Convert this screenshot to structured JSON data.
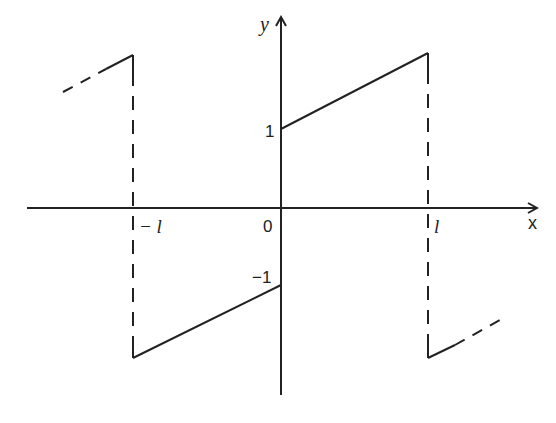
{
  "diagram": {
    "type": "function-graph",
    "colors": {
      "ink": "#222222",
      "background": "#ffffff"
    },
    "axes": {
      "x_label": "x",
      "y_label": "y",
      "origin_label": "0"
    },
    "ticks": {
      "x_neg": "− l",
      "x_pos": "l",
      "y_pos": "1",
      "y_neg": "−1"
    },
    "segments": [
      {
        "name": "right-upper",
        "from": [
          0,
          1
        ],
        "to": [
          "l",
          "max"
        ],
        "style": "solid"
      },
      {
        "name": "left-lower",
        "from": [
          "-l",
          "-max"
        ],
        "to": [
          0,
          -1
        ],
        "style": "solid"
      },
      {
        "name": "jump-at-l",
        "x": "l",
        "style": "dashed"
      },
      {
        "name": "jump-at-neg-l",
        "x": "-l",
        "style": "dashed"
      },
      {
        "name": "continuation-right",
        "from": [
          "l",
          "-max"
        ],
        "style": "solid-then-dashed"
      },
      {
        "name": "continuation-left",
        "to": [
          "-l",
          "max"
        ],
        "style": "dashed-then-solid"
      }
    ]
  }
}
